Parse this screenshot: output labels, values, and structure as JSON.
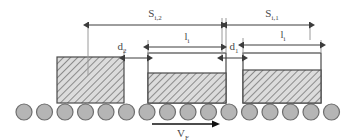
{
  "figure": {
    "type": "engineering-schematic",
    "background_color": "#ffffff",
    "line_color": "#4a4a4a",
    "hatch_color": "#7d7d7d",
    "roller_fill": "#b5b5b5",
    "roller_stroke": "#6e6e6e",
    "slab_fill": "#d9d9d9"
  },
  "labels": {
    "spacing_left": {
      "base": "S",
      "sub": "i,2"
    },
    "spacing_right": {
      "base": "S",
      "sub": "i,1"
    },
    "gap_left": {
      "base": "d",
      "sub": "2"
    },
    "gap_right": {
      "base": "d",
      "sub": "1"
    },
    "length_middle": {
      "base": "l",
      "sub": "i"
    },
    "length_right": {
      "base": "l",
      "sub": "i"
    },
    "velocity": {
      "base": "V",
      "sub": "F"
    }
  },
  "slabs": [
    {
      "id": "slab-left",
      "x": 57,
      "y": 57,
      "width": 67,
      "height": 46,
      "fill_top": 57
    },
    {
      "id": "slab-middle",
      "x": 148,
      "y": 53,
      "width": 78,
      "height": 50,
      "fill_top": 73
    },
    {
      "id": "slab-right",
      "x": 243,
      "y": 53,
      "width": 78,
      "height": 50,
      "fill_top": 70
    }
  ],
  "rollers": {
    "count": 16,
    "center_y": 112,
    "radius": 8,
    "first_center_x": 24,
    "spacing": 20.5
  },
  "dimension_lines": [
    {
      "name": "spacing-left",
      "y": 25,
      "x1": 88,
      "x2": 222
    },
    {
      "name": "spacing-right",
      "y": 25,
      "x1": 226,
      "x2": 310
    },
    {
      "name": "gap-left",
      "y": 58,
      "x1": 124,
      "x2": 148
    },
    {
      "name": "length-middle",
      "y": 47,
      "x1": 148,
      "x2": 222
    },
    {
      "name": "gap-right",
      "y": 58,
      "x1": 222,
      "x2": 243
    },
    {
      "name": "length-right",
      "y": 45,
      "x1": 243,
      "x2": 321
    }
  ],
  "velocity_arrow": {
    "y": 124,
    "x1": 152,
    "x2": 214
  }
}
